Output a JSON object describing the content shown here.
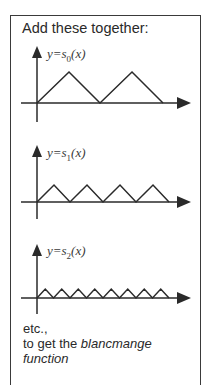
{
  "title": "Add these together:",
  "graphs": [
    {
      "label_prefix": "y=s",
      "label_sub": "0",
      "label_suffix": "(x)",
      "function_name": "s0",
      "triangles": 2,
      "peak_height_px": 31
    },
    {
      "label_prefix": "y=s",
      "label_sub": "1",
      "label_suffix": "(x)",
      "function_name": "s1",
      "triangles": 4,
      "peak_height_px": 18
    },
    {
      "label_prefix": "y=s",
      "label_sub": "2",
      "label_suffix": "(x)",
      "function_name": "s2",
      "triangles": 8,
      "peak_height_px": 9
    }
  ],
  "footer": {
    "line1": "etc.,",
    "line2_plain": "to get the ",
    "line2_italic": "blancmange",
    "line3_italic": "function"
  },
  "colors": {
    "ink": "#2a2a2a",
    "frame": "#3a3a3a",
    "background": "#ffffff"
  }
}
